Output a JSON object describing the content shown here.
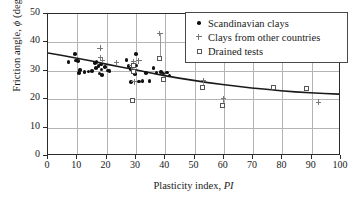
{
  "chart_data": {
    "type": "scatter",
    "title": "",
    "xlabel": "Plasticity index, PI",
    "xlabel_plain": "Plasticity index,",
    "xlabel_italic": "PI",
    "ylabel": "Friction angle, ϕ (deg)",
    "ylabel_plain_a": "Friction angle,",
    "ylabel_italic": "ϕ",
    "ylabel_plain_b": "(deg)",
    "xlim": [
      0,
      100
    ],
    "ylim": [
      0,
      50
    ],
    "xticks": [
      0,
      10,
      20,
      30,
      40,
      50,
      60,
      70,
      80,
      90,
      100
    ],
    "yticks": [
      0,
      10,
      20,
      30,
      40,
      50
    ],
    "grid": true,
    "legend_position": "top-right",
    "series": [
      {
        "name": "Scandinavian clays",
        "marker": "filled-circle",
        "color": "#111111",
        "points": [
          [
            7.0,
            33.2
          ],
          [
            9.2,
            35.9
          ],
          [
            9.6,
            33.6
          ],
          [
            10.3,
            33.5
          ],
          [
            10.6,
            29.2
          ],
          [
            11.0,
            30.2
          ],
          [
            12.4,
            29.6
          ],
          [
            13.8,
            29.7
          ],
          [
            15.0,
            29.9
          ],
          [
            16.0,
            32.7
          ],
          [
            16.3,
            30.9
          ],
          [
            16.6,
            33.2
          ],
          [
            17.2,
            31.6
          ],
          [
            17.6,
            29.0
          ],
          [
            18.0,
            32.2
          ],
          [
            18.2,
            30.4
          ],
          [
            18.4,
            28.6
          ],
          [
            19.5,
            31.3
          ],
          [
            20.5,
            30.1
          ],
          [
            21.0,
            30.0
          ],
          [
            26.8,
            33.7
          ],
          [
            27.5,
            31.6
          ],
          [
            28.2,
            30.6
          ],
          [
            28.4,
            26.0
          ],
          [
            29.0,
            32.1
          ],
          [
            29.3,
            30.0
          ],
          [
            29.6,
            28.8
          ],
          [
            30.0,
            35.9
          ],
          [
            30.2,
            31.9
          ],
          [
            31.0,
            26.3
          ],
          [
            32.3,
            26.5
          ],
          [
            33.4,
            29.3
          ],
          [
            34.6,
            26.5
          ],
          [
            36.0,
            31.0
          ],
          [
            37.0,
            29.4
          ],
          [
            38.6,
            29.6
          ],
          [
            39.4,
            29.1
          ],
          [
            40.6,
            29.4
          ],
          [
            41.5,
            28.3
          ]
        ]
      },
      {
        "name": "Clays from other countries",
        "marker": "plus",
        "color": "#777777",
        "points": [
          [
            17.8,
            38.0
          ],
          [
            18.0,
            34.6
          ],
          [
            18.6,
            33.8
          ],
          [
            23.4,
            32.8
          ],
          [
            28.6,
            31.7
          ],
          [
            29.2,
            33.3
          ],
          [
            29.4,
            26.1
          ],
          [
            31.0,
            33.5
          ],
          [
            38.2,
            43.2
          ],
          [
            53.0,
            26.6
          ],
          [
            59.8,
            20.1
          ],
          [
            92.4,
            19.0
          ]
        ]
      },
      {
        "name": "Drained tests",
        "marker": "open-square",
        "color": "#555555",
        "points": [
          [
            28.9,
            19.3
          ],
          [
            29.2,
            31.7
          ],
          [
            29.4,
            29.7
          ],
          [
            38.2,
            34.1
          ],
          [
            39.6,
            26.8
          ],
          [
            53.0,
            24.1
          ],
          [
            59.8,
            17.6
          ],
          [
            77.2,
            23.9
          ],
          [
            88.4,
            23.7
          ]
        ]
      }
    ],
    "error_bars": [
      {
        "x": 38.2,
        "y_top": 43.2,
        "y_bottom": 34.1
      },
      {
        "x": 53.0,
        "y_top": 26.6,
        "y_bottom": 24.1
      },
      {
        "x": 59.8,
        "y_top": 20.1,
        "y_bottom": 17.6
      }
    ],
    "trend_curve": {
      "name": "empirical correlation",
      "color": "#1a1a1a",
      "points": [
        [
          0,
          36.1
        ],
        [
          5,
          35.2
        ],
        [
          10,
          34.2
        ],
        [
          15,
          33.2
        ],
        [
          20,
          32.1
        ],
        [
          25,
          31.1
        ],
        [
          30,
          30.1
        ],
        [
          35,
          29.0
        ],
        [
          40,
          28.0
        ],
        [
          45,
          27.1
        ],
        [
          50,
          26.3
        ],
        [
          55,
          25.5
        ],
        [
          60,
          24.8
        ],
        [
          65,
          24.2
        ],
        [
          70,
          23.6
        ],
        [
          75,
          23.1
        ],
        [
          80,
          22.6
        ],
        [
          85,
          22.2
        ],
        [
          90,
          21.9
        ],
        [
          95,
          21.6
        ],
        [
          100,
          21.4
        ]
      ]
    }
  },
  "legend": {
    "entries": [
      {
        "label": "Scandinavian clays",
        "marker": "filled-circle"
      },
      {
        "label": "Clays from other countries",
        "marker": "plus"
      },
      {
        "label": "Drained tests",
        "marker": "open-square"
      }
    ]
  }
}
